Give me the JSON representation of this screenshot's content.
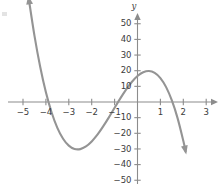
{
  "figure": {
    "title": "",
    "y_axis_name": "y",
    "corner_mark": "artifact"
  },
  "chart_data": {
    "type": "line",
    "title": "",
    "xlabel": "",
    "ylabel": "y",
    "grid": false,
    "legend": null,
    "xlim": [
      -5.6,
      3.4
    ],
    "ylim": [
      -56,
      58
    ],
    "xticks": [
      -5,
      -4,
      -3,
      -2,
      -1,
      1,
      2,
      3
    ],
    "xticklabels": [
      "−5",
      "−4",
      "−3",
      "−2",
      "−1",
      "1",
      "2",
      "3"
    ],
    "yticks": [
      50,
      40,
      30,
      20,
      10,
      -10,
      -20,
      -30,
      -40,
      -50
    ],
    "yticklabels": [
      "50",
      "40",
      "30",
      "20",
      "10",
      "−10",
      "−20",
      "−30",
      "−40",
      "−50"
    ],
    "axis_arrows": [
      "x-right",
      "y-up"
    ],
    "curve_arrows": [
      "upper-left",
      "lower-right"
    ],
    "function": "y = -4.6(x + 4)(x + 0.35)(x - 0.72)",
    "roots": [
      -4,
      -0.35,
      0.72
    ],
    "local_minimum": {
      "x": -2.7,
      "y": -17
    },
    "local_maximum": {
      "x": -0.15,
      "y": 3.5
    },
    "series": [
      {
        "name": "cubic",
        "color": "#949494",
        "x": [
          -4.75,
          -4.5,
          -4.25,
          -4.0,
          -3.75,
          -3.5,
          -3.25,
          -3.0,
          -2.75,
          -2.5,
          -2.25,
          -2.0,
          -1.75,
          -1.5,
          -1.25,
          -1.0,
          -0.75,
          -0.5,
          -0.25,
          0.0,
          0.25,
          0.5,
          0.75,
          1.0,
          1.25,
          1.5,
          1.75,
          2.0,
          2.1
        ],
        "y": [
          66.1,
          42.4,
          22.5,
          6.2,
          -6.7,
          -16.5,
          -23.5,
          -27.9,
          -30.0,
          -30.1,
          -28.4,
          -25.2,
          -20.9,
          -15.6,
          -9.8,
          -3.7,
          2.3,
          7.9,
          12.8,
          16.6,
          19.0,
          19.8,
          18.6,
          15.3,
          9.5,
          1.0,
          -10.3,
          -24.8,
          -31.6
        ]
      }
    ]
  }
}
